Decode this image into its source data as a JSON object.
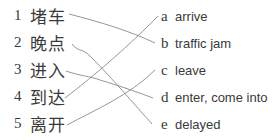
{
  "exercise": {
    "left": [
      {
        "num": "1",
        "text": "堵车"
      },
      {
        "num": "2",
        "text": "晚点"
      },
      {
        "num": "3",
        "text": "进入"
      },
      {
        "num": "4",
        "text": "到达"
      },
      {
        "num": "5",
        "text": "离开"
      }
    ],
    "right": [
      {
        "letter": "a",
        "text": "arrive"
      },
      {
        "letter": "b",
        "text": "traffic jam"
      },
      {
        "letter": "c",
        "text": "leave"
      },
      {
        "letter": "d",
        "text": "enter, come into"
      },
      {
        "letter": "e",
        "text": "delayed"
      }
    ],
    "matches": [
      {
        "from": "1",
        "to": "b"
      },
      {
        "from": "2",
        "to": "e"
      },
      {
        "from": "3",
        "to": "d"
      },
      {
        "from": "4",
        "to": "a"
      },
      {
        "from": "5",
        "to": "c"
      }
    ],
    "line_color": "#8a8a8a"
  }
}
